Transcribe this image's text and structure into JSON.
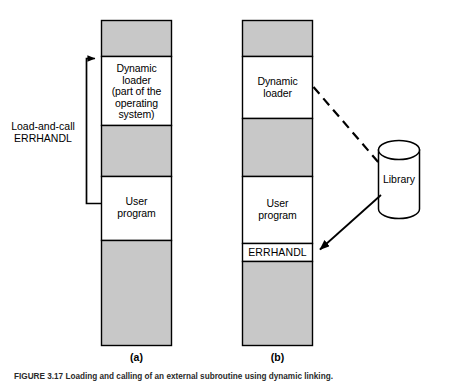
{
  "figure": {
    "background_color": "#ffffff",
    "block_fill_gray": "#c8c8c8",
    "block_fill_white": "#ffffff",
    "stroke_color": "#000000",
    "caption": "FIGURE 3.17   Loading and calling of an external subroutine using dynamic linking."
  },
  "panels": [
    {
      "id": "a",
      "caption": "(a)",
      "blocks": [
        {
          "name": "free-space-top",
          "fill": "gray",
          "label": ""
        },
        {
          "name": "dynamic-loader",
          "fill": "white",
          "label": "Dynamic\nloader\n(part of the\noperating\nsystem)"
        },
        {
          "name": "free-space-middle",
          "fill": "gray",
          "label": ""
        },
        {
          "name": "user-program",
          "fill": "white",
          "label": "User\nprogram"
        },
        {
          "name": "free-space-bottom",
          "fill": "gray",
          "label": ""
        }
      ],
      "annotation": {
        "name": "load-and-call-bracket",
        "label": "Load-and-call\nERRHANDL",
        "arrow_style": "solid",
        "from": "user-program",
        "to": "dynamic-loader"
      }
    },
    {
      "id": "b",
      "caption": "(b)",
      "blocks": [
        {
          "name": "free-space-top",
          "fill": "gray",
          "label": ""
        },
        {
          "name": "dynamic-loader",
          "fill": "white",
          "label": "Dynamic\nloader"
        },
        {
          "name": "free-space-middle",
          "fill": "gray",
          "label": ""
        },
        {
          "name": "user-program",
          "fill": "white",
          "label": "User\nprogram"
        },
        {
          "name": "errhandl",
          "fill": "white",
          "label": "ERRHANDL"
        },
        {
          "name": "free-space-bottom",
          "fill": "gray",
          "label": ""
        }
      ]
    }
  ],
  "library": {
    "name": "library-cylinder",
    "label": "Library",
    "shape": "cylinder"
  },
  "connectors": [
    {
      "name": "loader-to-library-connector",
      "style": "dashed",
      "from": "dynamic-loader",
      "to": "library-cylinder",
      "arrowhead": "none"
    },
    {
      "name": "library-to-errhandl-arrow",
      "style": "solid",
      "from": "library-cylinder",
      "to": "errhandl",
      "arrowhead": "at-errhandl"
    }
  ]
}
